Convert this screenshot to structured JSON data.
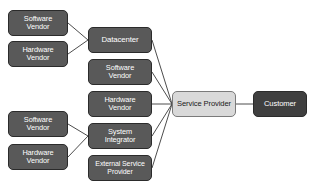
{
  "diagram": {
    "background": "#ffffff",
    "colors": {
      "node_fill": "#595959",
      "node_fill_dark": "#3f3f3f",
      "node_fill_light": "#d9d9d9",
      "node_border": "#2b2b2b",
      "node_text": "#ffffff",
      "node_text_dark": "#1a1a1a",
      "edge": "#4d4d4d"
    },
    "nodes": [
      {
        "id": "sw-vendor-top",
        "label": "Software\nVendor",
        "x": 8,
        "y": 10,
        "w": 60,
        "h": 26,
        "style": "mid",
        "font": 7.4
      },
      {
        "id": "hw-vendor-top",
        "label": "Hardware\nVendor",
        "x": 8,
        "y": 41,
        "w": 60,
        "h": 26,
        "style": "mid",
        "font": 7.4
      },
      {
        "id": "datacenter",
        "label": "Datacenter",
        "x": 88,
        "y": 27,
        "w": 64,
        "h": 26,
        "style": "mid",
        "font": 7.8
      },
      {
        "id": "sw-vendor-mid",
        "label": "Software\nVendor",
        "x": 88,
        "y": 59,
        "w": 64,
        "h": 26,
        "style": "mid",
        "font": 7.4
      },
      {
        "id": "hw-vendor-mid",
        "label": "Hardware\nVendor",
        "x": 88,
        "y": 91,
        "w": 64,
        "h": 26,
        "style": "mid",
        "font": 7.4
      },
      {
        "id": "system-integrator",
        "label": "System\nIntegrator",
        "x": 88,
        "y": 123,
        "w": 64,
        "h": 26,
        "style": "mid",
        "font": 7.4
      },
      {
        "id": "external-service",
        "label": "External Service\nProvider",
        "x": 88,
        "y": 155,
        "w": 64,
        "h": 26,
        "style": "mid",
        "font": 7.0
      },
      {
        "id": "sw-vendor-bot",
        "label": "Software\nVendor",
        "x": 8,
        "y": 111,
        "w": 60,
        "h": 26,
        "style": "mid",
        "font": 7.4
      },
      {
        "id": "hw-vendor-bot",
        "label": "Hardware\nVendor",
        "x": 8,
        "y": 144,
        "w": 60,
        "h": 26,
        "style": "mid",
        "font": 7.4
      },
      {
        "id": "service-provider",
        "label": "Service Provider",
        "x": 172,
        "y": 91,
        "w": 64,
        "h": 26,
        "style": "light",
        "font": 7.6
      },
      {
        "id": "customer",
        "label": "Customer",
        "x": 253,
        "y": 91,
        "w": 54,
        "h": 26,
        "style": "dark",
        "font": 7.6
      }
    ],
    "edges": [
      {
        "from": "sw-vendor-top",
        "to": "datacenter",
        "x1": 68,
        "y1": 23,
        "x2": 88,
        "y2": 40
      },
      {
        "from": "hw-vendor-top",
        "to": "datacenter",
        "x1": 68,
        "y1": 54,
        "x2": 88,
        "y2": 40
      },
      {
        "from": "datacenter",
        "to": "service-provider",
        "x1": 152,
        "y1": 40,
        "x2": 172,
        "y2": 104
      },
      {
        "from": "sw-vendor-mid",
        "to": "service-provider",
        "x1": 152,
        "y1": 72,
        "x2": 172,
        "y2": 104
      },
      {
        "from": "hw-vendor-mid",
        "to": "service-provider",
        "x1": 152,
        "y1": 104,
        "x2": 172,
        "y2": 104
      },
      {
        "from": "system-integrator",
        "to": "service-provider",
        "x1": 152,
        "y1": 136,
        "x2": 172,
        "y2": 104
      },
      {
        "from": "external-service",
        "to": "service-provider",
        "x1": 152,
        "y1": 168,
        "x2": 172,
        "y2": 104
      },
      {
        "from": "sw-vendor-bot",
        "to": "system-integrator",
        "x1": 68,
        "y1": 124,
        "x2": 88,
        "y2": 136
      },
      {
        "from": "hw-vendor-bot",
        "to": "system-integrator",
        "x1": 68,
        "y1": 157,
        "x2": 88,
        "y2": 136
      },
      {
        "from": "service-provider",
        "to": "customer",
        "x1": 236,
        "y1": 104,
        "x2": 253,
        "y2": 104
      }
    ]
  }
}
